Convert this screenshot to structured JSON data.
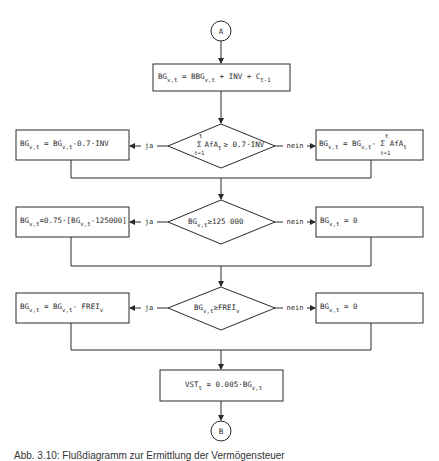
{
  "connectors": {
    "start": "A",
    "end": "B"
  },
  "boxes": {
    "init": {
      "main": "BG",
      "sub1": "v,t",
      "eq": " = BBG",
      "sub2": "v,t",
      "rest": " + INV + C",
      "sub3": "t-1"
    },
    "row1_left": {
      "a": "BG",
      "s1": "v,t",
      "b": " = BG",
      "s2": "v,t",
      "c": "-0.7·INV"
    },
    "row1_right": {
      "a": "BG",
      "s1": "v,t",
      "b": " = BG",
      "s2": "v,t",
      "c": "- Σ AfA",
      "s3": "t",
      "top": "t",
      "bottom": "τ=1"
    },
    "row2_left": {
      "a": "BG",
      "s1": "v,t",
      "b": "=0.75·[BG",
      "s2": "v,t",
      "c": "-125000]"
    },
    "row2_right": {
      "a": "BG",
      "s1": "v,t",
      "b": " = 0"
    },
    "row3_left": {
      "a": "BG",
      "s1": "v,t",
      "b": " = BG",
      "s2": "v,t",
      "c": "- FREI",
      "s3": "v"
    },
    "row3_right": {
      "a": "BG",
      "s1": "v,t",
      "b": " = 0"
    },
    "final": {
      "a": "VST",
      "s1": "t",
      "b": " = 0.005·BG",
      "s2": "v,t"
    }
  },
  "decisions": {
    "d1": {
      "top": "t",
      "sigma": "Σ",
      "a": "AfA",
      "s1": "t",
      "b": "≥ 0.7·INV",
      "bottom": "τ=1"
    },
    "d2": {
      "a": "BG",
      "s1": "v,t",
      "b": "≥125 000"
    },
    "d3": {
      "a": "BG",
      "s1": "v,t",
      "b": "≥FREI",
      "s2": "v"
    }
  },
  "branch_labels": {
    "yes": "ja",
    "no": "nein"
  },
  "caption": "Abb. 3.10: Flußdiagramm zur Ermittlung der Vermögensteuer"
}
